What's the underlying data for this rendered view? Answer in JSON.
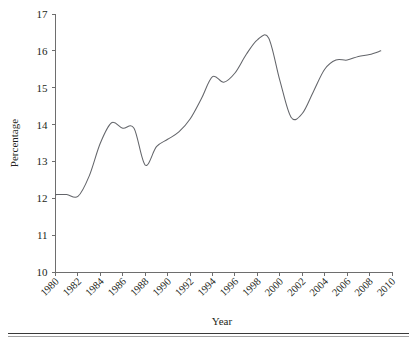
{
  "chart_data": {
    "type": "line",
    "title": "",
    "xlabel": "Year",
    "ylabel": "Percentage",
    "xlim": [
      1980,
      2010
    ],
    "ylim": [
      10,
      17
    ],
    "grid": false,
    "legend": null,
    "xticks": [
      1980,
      1982,
      1984,
      1986,
      1988,
      1990,
      1992,
      1994,
      1996,
      1998,
      2000,
      2002,
      2004,
      2006,
      2008,
      2010
    ],
    "xtick_labels": [
      "1980",
      "1982",
      "1984",
      "1986",
      "1988",
      "1990",
      "1992",
      "1994",
      "1996",
      "1998",
      "2000",
      "2002",
      "2004",
      "2006",
      "2008",
      "2010"
    ],
    "yticks": [
      10,
      11,
      12,
      13,
      14,
      15,
      16,
      17
    ],
    "ytick_labels": [
      "10",
      "11",
      "12",
      "13",
      "14",
      "15",
      "16",
      "17"
    ],
    "series": [
      {
        "name": "Percentage",
        "color": "#63656a",
        "x": [
          1980,
          1981,
          1982,
          1983,
          1984,
          1985,
          1986,
          1987,
          1988,
          1989,
          1990,
          1991,
          1992,
          1993,
          1994,
          1995,
          1996,
          1997,
          1998,
          1999,
          2000,
          2001,
          2002,
          2003,
          2004,
          2005,
          2006,
          2007,
          2008,
          2009
        ],
        "values": [
          12.1,
          12.1,
          12.05,
          12.6,
          13.5,
          14.05,
          13.9,
          13.9,
          12.9,
          13.4,
          13.6,
          13.8,
          14.15,
          14.7,
          15.3,
          15.15,
          15.4,
          15.9,
          16.3,
          16.35,
          15.2,
          14.2,
          14.3,
          14.9,
          15.5,
          15.75,
          15.75,
          15.85,
          15.9,
          16.0
        ]
      }
    ]
  },
  "axis": {
    "y_title": "Percentage",
    "x_title": "Year"
  }
}
